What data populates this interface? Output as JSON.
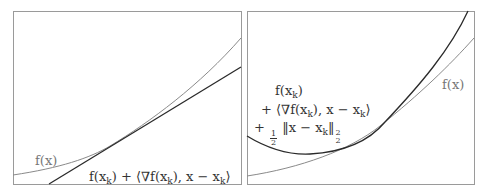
{
  "panels": [
    {
      "id": "first-order",
      "labels": {
        "f": "f(x)",
        "model_prefix": "f(x",
        "model_sub": "k",
        "model_mid": ") + ⟨∇f(x",
        "model_mid2": "), x − x",
        "model_end": "⟩"
      }
    },
    {
      "id": "quadratic-upper-bound",
      "labels": {
        "f": "f(x)",
        "line1_prefix": "f(x",
        "line1_sub": "k",
        "line1_end": ")",
        "line2_prefix": "+ ⟨∇f(x",
        "line2_mid": "), x − x",
        "line2_end": "⟩",
        "line3_plus": "+",
        "line3_num": "1",
        "line3_den": "2",
        "line3_norm": "‖x − x",
        "line3_norm_end": "‖",
        "line3_sup": "2",
        "line3_sub": "2"
      }
    }
  ],
  "colors": {
    "frame": "#9a9a9a",
    "function_curve": "#8a8a8a",
    "model_curve": "#2a2a2a"
  }
}
